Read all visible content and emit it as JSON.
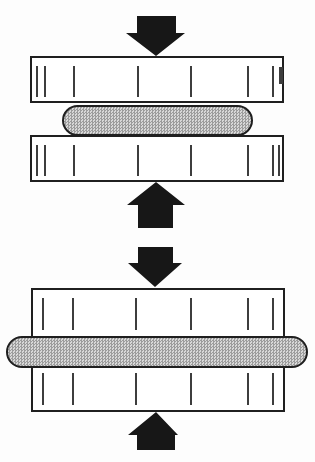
{
  "colors": {
    "paper": "#fdfdfd",
    "line": "#1f1f1f",
    "arrow": "#171717",
    "plate_fill": "#ffffff",
    "tick": "#3d3d3d",
    "specimen_base": "#d8d8d8",
    "specimen_dot": "#9c9c9c"
  },
  "diagram": {
    "stages": [
      {
        "name": "initial-stage-thick-specimen",
        "arrows": {
          "top_icon": "arrow-down-icon",
          "bottom_icon": "arrow-up-icon"
        },
        "upper_platen": {
          "ticks": [
            {
              "x": 4
            },
            {
              "x": 12
            },
            {
              "x": 41
            },
            {
              "x": 105
            },
            {
              "x": 158
            },
            {
              "x": 215
            },
            {
              "x": 240
            },
            {
              "x": 247,
              "w": 3.5,
              "h": 17,
              "top": 9
            }
          ]
        },
        "specimen": {
          "shape": "rounded-oval",
          "pattern": "crosshatch-stipple"
        },
        "lower_platen": {
          "ticks": [
            {
              "x": 4
            },
            {
              "x": 12
            },
            {
              "x": 41
            },
            {
              "x": 105
            },
            {
              "x": 158
            },
            {
              "x": 215
            },
            {
              "x": 240
            },
            {
              "x": 246
            }
          ]
        }
      },
      {
        "name": "final-stage-flattened-specimen",
        "arrows": {
          "top_icon": "arrow-down-icon",
          "bottom_icon": "arrow-up-icon"
        },
        "platen_block": {
          "upper_ticks": [
            {
              "x": 9
            },
            {
              "x": 39
            },
            {
              "x": 102
            },
            {
              "x": 157
            },
            {
              "x": 214
            },
            {
              "x": 239
            }
          ],
          "lower_ticks": [
            {
              "x": 9
            },
            {
              "x": 39
            },
            {
              "x": 102
            },
            {
              "x": 157
            },
            {
              "x": 214
            },
            {
              "x": 239
            }
          ]
        },
        "specimen": {
          "shape": "flattened-bar-overhanging-platens",
          "pattern": "crosshatch-stipple"
        }
      }
    ]
  }
}
